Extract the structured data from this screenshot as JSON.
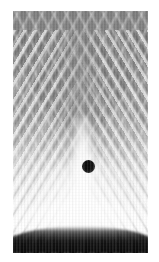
{
  "figure": {
    "title": "",
    "kind": "grayscale-interference-image",
    "width_px": 159,
    "height_px": 262,
    "background_color": "#ffffff",
    "plate": {
      "left_px": 13,
      "top_px": 11,
      "width_px": 135,
      "height_px": 242,
      "description": "Grayscale experimental image showing a dark conical (V-shaped) wedge at the top, symmetric diagonal interference fringes radiating outward on both sides, a bright vertical column below the cone apex, a small dark circular obstacle near the centre, a bright curved arc near the bottom, and a black band along the bottom edge."
    },
    "tones": {
      "top_gray": "#8f8f8f",
      "cone_gray": "#7a7a7a",
      "mid_gray": "#ababab",
      "bright_white": "#ffffff",
      "bottom_black": "#101010",
      "dot_black": "#0b0b0b"
    },
    "features": {
      "cone": {
        "label": "dark-cone-wedge",
        "apex_x_px": 82,
        "apex_y_px": 130,
        "half_angle_deg": 29
      },
      "dark_dot": {
        "label": "dark-circular-obstacle",
        "center_x_px": 82,
        "center_y_px": 162,
        "diameter_px": 13,
        "color": "#0b0b0b"
      },
      "bright_column": {
        "label": "bright-vertical-jet",
        "center_x_px": 82,
        "top_y_px": 130,
        "bottom_y_px": 240
      },
      "fringes": {
        "label": "diagonal-interference-fringes",
        "left_angle_deg": 121,
        "right_angle_deg": 59,
        "spacing_px": 9,
        "count_per_side": 14
      },
      "bottom_arc": {
        "label": "bright-curved-arc",
        "center_y_px": 232
      },
      "bottom_band": {
        "label": "dark-bottom-band",
        "top_y_px": 236,
        "bottom_y_px": 253
      }
    }
  }
}
